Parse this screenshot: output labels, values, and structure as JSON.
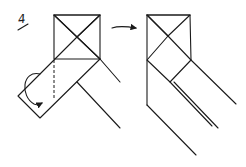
{
  "diagram": {
    "step_number": "4",
    "panels": [
      {
        "name": "before-fold",
        "description": "Hatched strip folded diagonally over square with X crease, curved arrow indicating fold-under"
      },
      {
        "name": "after-fold",
        "description": "Result: square with X crease, hatched triangles, two diagonal strips extending down-right"
      }
    ],
    "arrow": "right-arrow",
    "colors": {
      "ink": "#1a1a1a",
      "background": "#ffffff"
    }
  }
}
